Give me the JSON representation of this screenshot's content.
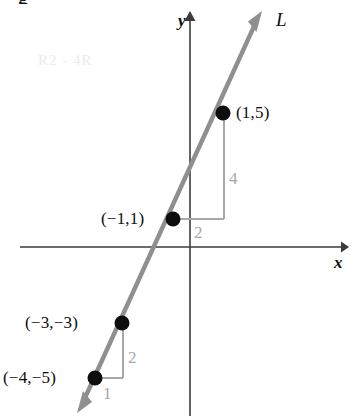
{
  "figure": {
    "kind": "coordinate-plane-line-graph",
    "width": 363,
    "height": 416,
    "background": "#ffffff"
  },
  "axes": {
    "x_label": "x",
    "y_label": "y",
    "axis_color": "#3b3b3b",
    "origin_px": {
      "x": 190,
      "y": 247
    },
    "x_axis_px": {
      "x1": 20,
      "x2": 348,
      "y": 247
    },
    "y_axis_px": {
      "x": 190,
      "y1": 12,
      "y2": 416
    }
  },
  "line": {
    "name_label": "L",
    "color": "#8f8f8f",
    "slope": 2,
    "y_intercept": 3,
    "equation": "y = 2x + 3",
    "arrow_head_top_px": {
      "x": 262,
      "y": 12
    },
    "arrow_head_bottom_px": {
      "x": 77,
      "y": 412
    }
  },
  "points": [
    {
      "id": "p1",
      "label": "(1,5)",
      "x": 1,
      "y": 5,
      "px": {
        "x": 223,
        "y": 113
      },
      "label_px": {
        "x": 236,
        "y": 105
      }
    },
    {
      "id": "p2",
      "label": "(−1,1)",
      "x": -1,
      "y": 1,
      "px": {
        "x": 173,
        "y": 219
      },
      "label_px": {
        "x": 102,
        "y": 211
      }
    },
    {
      "id": "p3",
      "label": "(−3,−3)",
      "x": -3,
      "y": -3,
      "px": {
        "x": 122,
        "y": 323
      },
      "label_px": {
        "x": 26,
        "y": 315
      }
    },
    {
      "id": "p4",
      "label": "(−4,−5)",
      "x": -4,
      "y": -5,
      "px": {
        "x": 95,
        "y": 378
      },
      "label_px": {
        "x": 4,
        "y": 370
      }
    }
  ],
  "slope_triangles": [
    {
      "id": "upper",
      "run_label": "2",
      "rise_label": "4",
      "color": "#a8a8a8",
      "from_point": "p2",
      "to_point": "p1",
      "run_label_px": {
        "x": 195,
        "y": 250
      },
      "rise_label_px": {
        "x": 230,
        "y": 188
      }
    },
    {
      "id": "lower",
      "run_label": "1",
      "rise_label": "2",
      "color": "#a8a8a8",
      "from_point": "p4",
      "to_point": "p3",
      "run_label_px": {
        "x": 104,
        "y": 404
      },
      "rise_label_px": {
        "x": 128,
        "y": 367
      }
    }
  ],
  "artifacts": {
    "cropped_top_glyph": "g",
    "bleed_text": "R2 - 4R"
  }
}
